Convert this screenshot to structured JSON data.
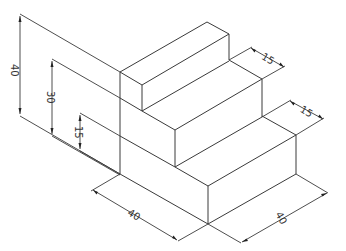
{
  "diagram": {
    "type": "isometric-technical-drawing",
    "line_color": "#3a3a3a",
    "background": "#ffffff"
  },
  "dimensions": {
    "height_total": "40",
    "height_step2": "30",
    "height_step1": "15",
    "tread_upper": "15",
    "tread_lower": "15",
    "width_front": "40",
    "depth_right": "40"
  }
}
